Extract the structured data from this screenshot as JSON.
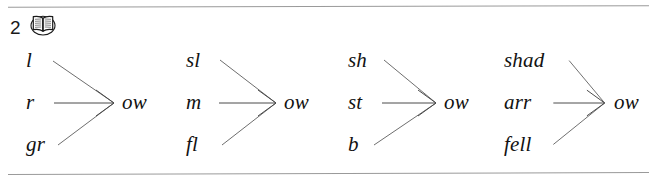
{
  "worksheet": {
    "exercise_number": "2",
    "icon": "open-book-icon",
    "rules": {
      "top": true,
      "bottom": true
    },
    "colors": {
      "ink": "#121212",
      "rule": "#9a9a9a",
      "connector": "#6e6e6e",
      "background": "#ffffff"
    },
    "groups": [
      {
        "id": "group-1",
        "onsets": [
          "l",
          "r",
          "gr"
        ],
        "rime": "ow",
        "words": [
          "low",
          "row",
          "grow"
        ]
      },
      {
        "id": "group-2",
        "onsets": [
          "sl",
          "m",
          "fl"
        ],
        "rime": "ow",
        "words": [
          "slow",
          "mow",
          "flow"
        ]
      },
      {
        "id": "group-3",
        "onsets": [
          "sh",
          "st",
          "b"
        ],
        "rime": "ow",
        "words": [
          "show",
          "stow",
          "bow"
        ]
      },
      {
        "id": "group-4",
        "onsets": [
          "shad",
          "arr",
          "fell"
        ],
        "rime": "ow",
        "words": [
          "shadow",
          "arrow",
          "fellow"
        ]
      }
    ]
  }
}
